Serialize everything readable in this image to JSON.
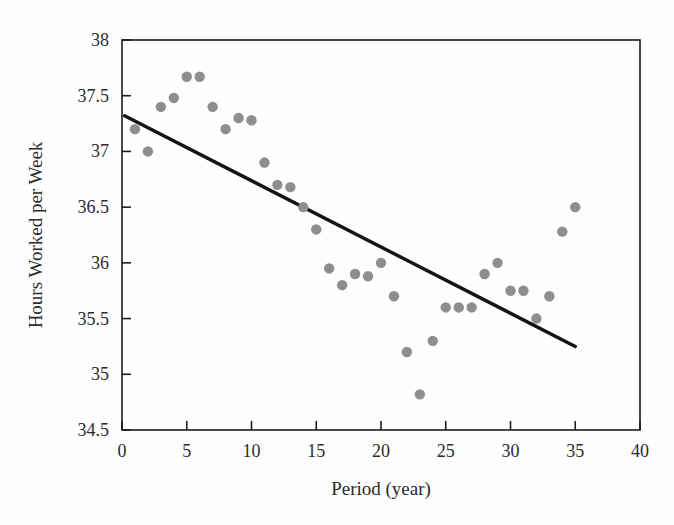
{
  "chart_data": {
    "type": "scatter",
    "title": "",
    "xlabel": "Period (year)",
    "ylabel": "Hours Worked per Week",
    "xlim": [
      0,
      40
    ],
    "ylim": [
      34.5,
      38
    ],
    "xticks": [
      0,
      5,
      10,
      15,
      20,
      25,
      30,
      35,
      40
    ],
    "yticks": [
      34.5,
      35,
      35.5,
      36,
      36.5,
      37,
      37.5,
      38
    ],
    "xtick_labels": [
      "0",
      "5",
      "10",
      "15",
      "20",
      "25",
      "30",
      "35",
      "40"
    ],
    "ytick_labels": [
      "34.5",
      "35",
      "35.5",
      "36",
      "36.5",
      "37",
      "37.5",
      "38"
    ],
    "grid": false,
    "legend": "none",
    "marker_color": "#8e8e8e",
    "line_color": "#141414",
    "series": [
      {
        "name": "Hours Worked per Week",
        "kind": "scatter",
        "x": [
          1,
          2,
          3,
          4,
          5,
          6,
          7,
          8,
          9,
          10,
          11,
          12,
          13,
          14,
          15,
          16,
          17,
          18,
          19,
          20,
          21,
          22,
          23,
          24,
          25,
          26,
          27,
          28,
          29,
          30,
          31,
          32,
          33,
          34,
          35
        ],
        "y": [
          37.2,
          37.0,
          37.4,
          37.48,
          37.67,
          37.67,
          37.4,
          37.2,
          37.3,
          37.28,
          36.9,
          36.7,
          36.68,
          36.5,
          36.3,
          35.95,
          35.8,
          35.9,
          35.88,
          36.0,
          35.7,
          35.2,
          34.82,
          35.3,
          35.6,
          35.6,
          35.6,
          35.9,
          36.0,
          35.75,
          35.75,
          35.5,
          35.7,
          36.28,
          36.5
        ]
      },
      {
        "name": "Linear trend",
        "kind": "line",
        "x": [
          0.2,
          35.0
        ],
        "y": [
          37.32,
          35.25
        ]
      }
    ],
    "annotations": []
  },
  "figure": {
    "background_color": "#fefefe",
    "frame_color": "#1c1c1c"
  }
}
